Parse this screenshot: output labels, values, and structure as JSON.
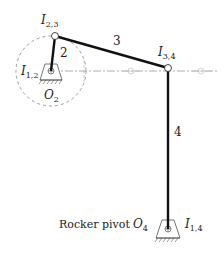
{
  "diagram": {
    "type": "four-bar linkage",
    "links": [
      {
        "id": "2",
        "label": "2",
        "from": "O2",
        "to": "I23"
      },
      {
        "id": "3",
        "label": "3",
        "from": "I23",
        "to": "I34"
      },
      {
        "id": "4",
        "label": "4",
        "from": "I34",
        "to": "O4"
      }
    ],
    "labels": {
      "i23": {
        "main": "I",
        "sub": "2,3"
      },
      "i34": {
        "main": "I",
        "sub": "3,4"
      },
      "i12": {
        "main": "I",
        "sub": "1,2"
      },
      "i14": {
        "main": "I",
        "sub": "1,4"
      },
      "o2": {
        "main": "O",
        "sub": "2"
      },
      "o4": {
        "main": "O",
        "sub": "4"
      },
      "link2": "2",
      "link3": "3",
      "link4": "4",
      "rocker_pivot": "Rocker pivot"
    },
    "points": {
      "O2": [
        51,
        71
      ],
      "I23": [
        55,
        36
      ],
      "I34": [
        168,
        68
      ],
      "O4": [
        168,
        229
      ]
    },
    "colors": {
      "link": "#111111",
      "construction": "#9a9a9a",
      "ground": "#555555"
    }
  }
}
